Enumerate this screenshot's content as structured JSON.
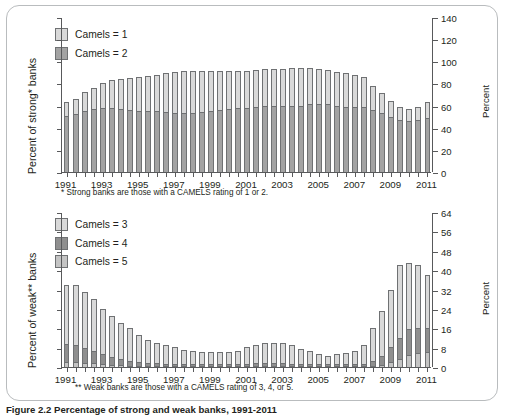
{
  "figure": {
    "caption": "Figure 2.2 Percentage of strong and weak banks, 1991-2011",
    "background": "#ffffff",
    "frame_color": "#b9bcbe"
  },
  "colors": {
    "camels1": "#d9d9d9",
    "camels2": "#a3a3a3",
    "camels3": "#d9d9d9",
    "camels4": "#8f8f8f",
    "camels5": "#c4c4c4",
    "axis": "#58595b",
    "bar_outline": "#6f7173"
  },
  "panels": [
    {
      "id": "strong-banks",
      "ylabel": "Percent of strong* banks",
      "right_axis_title": "Percent",
      "footnote": "* Strong banks are those with a CAMELS rating of 1 or 2.",
      "legend": [
        {
          "label": "Camels = 1",
          "color": "#d9d9d9"
        },
        {
          "label": "Camels = 2",
          "color": "#a3a3a3"
        }
      ]
    },
    {
      "id": "weak-banks",
      "ylabel": "Percent of weak** banks",
      "right_axis_title": "Percent",
      "footnote": "** Weak banks are those with a CAMELS rating of 3, 4, or 5.",
      "legend": [
        {
          "label": "Camels = 3",
          "color": "#d9d9d9"
        },
        {
          "label": "Camels = 4",
          "color": "#8f8f8f"
        },
        {
          "label": "Camels = 5",
          "color": "#c4c4c4"
        }
      ]
    }
  ],
  "chart_data": [
    {
      "type": "bar",
      "id": "strong-banks",
      "stacked": true,
      "title": "",
      "xlabel": "",
      "ylabel": "Percent of strong* banks",
      "right_ylabel": "Percent",
      "ylim": [
        0,
        140
      ],
      "yticks": [
        0,
        20,
        40,
        60,
        80,
        100,
        120,
        140
      ],
      "ytick_labels": [
        "0",
        "20",
        "40",
        "60",
        "80",
        "100",
        "120",
        "140"
      ],
      "grid": false,
      "legend_position": "top-left",
      "xtick_labels": [
        "1991",
        "1993",
        "1995",
        "1997",
        "1999",
        "2001",
        "2003",
        "2005",
        "2007",
        "2009",
        "2011"
      ],
      "x": [
        "1991Q1",
        "1991Q3",
        "1992Q1",
        "1992Q3",
        "1993Q1",
        "1993Q3",
        "1994Q1",
        "1994Q3",
        "1995Q1",
        "1995Q3",
        "1996Q1",
        "1996Q3",
        "1997Q1",
        "1997Q3",
        "1998Q1",
        "1998Q3",
        "1999Q1",
        "1999Q3",
        "2000Q1",
        "2000Q3",
        "2001Q1",
        "2001Q3",
        "2002Q1",
        "2002Q3",
        "2003Q1",
        "2003Q3",
        "2004Q1",
        "2004Q3",
        "2005Q1",
        "2005Q3",
        "2006Q1",
        "2006Q3",
        "2007Q1",
        "2007Q3",
        "2008Q1",
        "2008Q3",
        "2009Q1",
        "2009Q3",
        "2010Q1",
        "2010Q3",
        "2011Q1"
      ],
      "series": [
        {
          "name": "Camels = 2",
          "color": "#a3a3a3",
          "values": [
            51,
            52,
            55,
            57,
            58,
            58,
            57,
            56,
            55,
            55,
            55,
            54,
            53,
            53,
            53,
            54,
            55,
            56,
            57,
            58,
            58,
            59,
            60,
            60,
            60,
            60,
            60,
            61,
            61,
            61,
            60,
            59,
            59,
            59,
            56,
            53,
            50,
            47,
            46,
            47,
            49
          ]
        },
        {
          "name": "Camels = 1",
          "color": "#d9d9d9",
          "values": [
            12,
            14,
            17,
            19,
            22,
            25,
            27,
            29,
            31,
            32,
            33,
            35,
            37,
            38,
            38,
            37,
            36,
            35,
            34,
            33,
            33,
            33,
            33,
            33,
            33,
            34,
            34,
            33,
            32,
            31,
            30,
            30,
            29,
            27,
            22,
            18,
            14,
            12,
            11,
            12,
            14
          ]
        }
      ],
      "totals": [
        63,
        66,
        72,
        76,
        80,
        83,
        84,
        85,
        86,
        87,
        88,
        89,
        90,
        91,
        91,
        91,
        91,
        91,
        91,
        91,
        91,
        92,
        93,
        93,
        93,
        94,
        94,
        94,
        93,
        92,
        90,
        89,
        88,
        86,
        78,
        71,
        64,
        59,
        57,
        59,
        63
      ]
    },
    {
      "type": "bar",
      "id": "weak-banks",
      "stacked": true,
      "title": "",
      "xlabel": "",
      "ylabel": "Percent of weak** banks",
      "right_ylabel": "Percent",
      "ylim": [
        0,
        64
      ],
      "yticks": [
        0,
        8,
        16,
        24,
        32,
        40,
        48,
        56,
        64
      ],
      "ytick_labels": [
        "0",
        "8",
        "16",
        "24",
        "32",
        "40",
        "48",
        "56",
        "64"
      ],
      "grid": false,
      "legend_position": "top-left",
      "xtick_labels": [
        "1991",
        "1993",
        "1995",
        "1997",
        "1999",
        "2001",
        "2003",
        "2005",
        "2007",
        "2009",
        "2011"
      ],
      "x": [
        "1991Q1",
        "1991Q3",
        "1992Q1",
        "1992Q3",
        "1993Q1",
        "1993Q3",
        "1994Q1",
        "1994Q3",
        "1995Q1",
        "1995Q3",
        "1996Q1",
        "1996Q3",
        "1997Q1",
        "1997Q3",
        "1998Q1",
        "1998Q3",
        "1999Q1",
        "1999Q3",
        "2000Q1",
        "2000Q3",
        "2001Q1",
        "2001Q3",
        "2002Q1",
        "2002Q3",
        "2003Q1",
        "2003Q3",
        "2004Q1",
        "2004Q3",
        "2005Q1",
        "2005Q3",
        "2006Q1",
        "2006Q3",
        "2007Q1",
        "2007Q3",
        "2008Q1",
        "2008Q3",
        "2009Q1",
        "2009Q3",
        "2010Q1",
        "2010Q3",
        "2011Q1"
      ],
      "series": [
        {
          "name": "Camels = 5",
          "color": "#c4c4c4",
          "values": [
            2.0,
            2.0,
            1.8,
            1.6,
            1.3,
            1.0,
            0.8,
            0.6,
            0.4,
            0.3,
            0.3,
            0.2,
            0.2,
            0.2,
            0.2,
            0.2,
            0.2,
            0.2,
            0.2,
            0.2,
            0.3,
            0.3,
            0.3,
            0.3,
            0.3,
            0.3,
            0.2,
            0.2,
            0.2,
            0.2,
            0.2,
            0.2,
            0.2,
            0.3,
            0.5,
            1.0,
            2.2,
            3.5,
            5.0,
            5.6,
            6.0
          ]
        },
        {
          "name": "Camels = 4",
          "color": "#8f8f8f",
          "values": [
            7.5,
            7.0,
            6.0,
            5.2,
            4.2,
            3.3,
            2.6,
            2.0,
            1.6,
            1.3,
            1.1,
            0.9,
            0.8,
            0.7,
            0.7,
            0.7,
            0.7,
            0.7,
            0.8,
            0.9,
            1.0,
            1.1,
            1.2,
            1.2,
            1.1,
            1.0,
            0.9,
            0.8,
            0.7,
            0.7,
            0.7,
            0.7,
            0.8,
            1.0,
            2.0,
            3.5,
            6.0,
            8.5,
            10.5,
            10.5,
            10.0
          ]
        },
        {
          "name": "Camels = 3",
          "color": "#d9d9d9",
          "values": [
            24.5,
            25.0,
            23.2,
            21.2,
            18.5,
            16.7,
            14.6,
            13.4,
            11.0,
            9.4,
            8.6,
            7.9,
            7.0,
            6.1,
            5.6,
            5.1,
            4.9,
            5.1,
            5.0,
            5.3,
            6.7,
            7.7,
            8.5,
            8.5,
            8.6,
            7.7,
            6.1,
            5.2,
            4.1,
            3.6,
            4.1,
            4.6,
            5.3,
            7.7,
            13.5,
            18.5,
            23.8,
            30.0,
            27.5,
            25.9,
            22.0
          ]
        }
      ],
      "totals": [
        34.0,
        34.0,
        31.0,
        28.0,
        24.0,
        21.0,
        18.0,
        16.0,
        13.0,
        11.0,
        10.0,
        9.0,
        8.0,
        7.0,
        6.5,
        6.0,
        5.8,
        6.0,
        6.0,
        6.4,
        8.0,
        9.1,
        10.0,
        10.0,
        10.0,
        9.0,
        7.2,
        6.2,
        5.0,
        4.5,
        5.0,
        5.5,
        6.3,
        9.0,
        16.0,
        23.0,
        32.0,
        42.0,
        43.0,
        42.0,
        38.0
      ]
    }
  ]
}
